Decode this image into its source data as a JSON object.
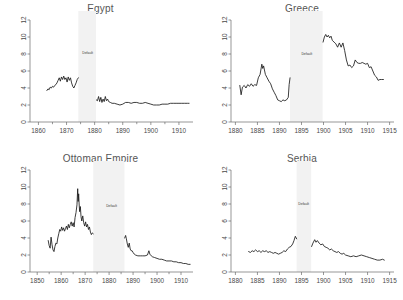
{
  "figure": {
    "panel_order": [
      "egypt",
      "greece",
      "ottoman",
      "serbia"
    ],
    "annotation_label": "Default",
    "series_color": "#1a1a1a",
    "band_color": "#f2f2f2",
    "axis_color": "#6b6b6b",
    "title_color": "#555555"
  },
  "chart_data": [
    {
      "type": "line",
      "title": "Egypt",
      "xlabel": "",
      "ylabel": "",
      "xlim": [
        1857,
        1915
      ],
      "ylim": [
        0,
        12
      ],
      "yticks": [
        0,
        2,
        4,
        6,
        8,
        10,
        12
      ],
      "xticks": [
        1860,
        1870,
        1880,
        1890,
        1900,
        1910
      ],
      "xminor": [
        1865,
        1875,
        1885,
        1895,
        1905
      ],
      "grid": false,
      "legend": "none",
      "annotations": [
        {
          "text": "Default",
          "x": 1877.5,
          "y": 8.0
        }
      ],
      "default_band": [
        1874.2,
        1880.5
      ],
      "series": [
        {
          "name": "pre-default",
          "x": [
            1863.0,
            1863.4,
            1863.8,
            1864.2,
            1864.6,
            1865.0,
            1865.4,
            1865.8,
            1866.2,
            1866.6,
            1867.0,
            1867.4,
            1867.8,
            1868.2,
            1868.6,
            1869.0,
            1869.4,
            1869.8,
            1870.2,
            1870.6,
            1871.0,
            1871.4,
            1871.8,
            1872.2,
            1872.6,
            1873.0,
            1873.4,
            1873.8,
            1874.2
          ],
          "values": [
            3.7,
            3.9,
            3.8,
            4.1,
            4.0,
            4.2,
            4.1,
            4.3,
            4.4,
            4.6,
            4.9,
            5.2,
            4.8,
            5.3,
            5.0,
            5.4,
            5.0,
            5.2,
            4.7,
            5.3,
            4.9,
            5.2,
            4.6,
            4.2,
            4.0,
            4.3,
            4.6,
            5.0,
            5.2
          ]
        },
        {
          "name": "post-default",
          "x": [
            1880.6,
            1881.0,
            1881.4,
            1881.8,
            1882.2,
            1882.6,
            1883.0,
            1883.4,
            1883.8,
            1884.2,
            1884.6,
            1885.0,
            1885.6,
            1886.2,
            1887.0,
            1888.0,
            1889.0,
            1890.0,
            1891.0,
            1892.0,
            1893.0,
            1894.0,
            1895.0,
            1896.0,
            1897.0,
            1898.0,
            1899.0,
            1900.0,
            1901.0,
            1902.0,
            1903.0,
            1904.0,
            1905.0,
            1906.0,
            1907.0,
            1908.0,
            1909.0,
            1910.0,
            1911.0,
            1912.0,
            1913.0,
            1913.6
          ],
          "values": [
            2.6,
            2.5,
            3.0,
            2.4,
            2.9,
            2.3,
            2.7,
            2.4,
            3.0,
            2.5,
            2.7,
            2.4,
            2.3,
            2.2,
            2.2,
            2.1,
            2.0,
            2.1,
            2.3,
            2.3,
            2.2,
            2.3,
            2.3,
            2.2,
            2.2,
            2.3,
            2.2,
            2.1,
            2.0,
            2.0,
            2.0,
            2.1,
            2.1,
            2.1,
            2.2,
            2.2,
            2.2,
            2.2,
            2.2,
            2.2,
            2.2,
            2.2
          ]
        }
      ]
    },
    {
      "type": "line",
      "title": "Greece",
      "xlabel": "",
      "ylabel": "",
      "xlim": [
        1879,
        1916
      ],
      "ylim": [
        0,
        12
      ],
      "yticks": [
        0,
        2,
        4,
        6,
        8,
        10,
        12
      ],
      "xticks": [
        1880,
        1885,
        1890,
        1895,
        1900,
        1905,
        1910,
        1915
      ],
      "xminor": [],
      "grid": false,
      "legend": "none",
      "annotations": [
        {
          "text": "Default",
          "x": 1896.2,
          "y": 7.9
        }
      ],
      "default_band": [
        1892.4,
        1899.8
      ],
      "series": [
        {
          "name": "pre-default",
          "x": [
            1881.0,
            1881.3,
            1881.6,
            1882.0,
            1882.4,
            1882.8,
            1883.2,
            1883.6,
            1884.0,
            1884.4,
            1884.8,
            1885.2,
            1885.6,
            1886.0,
            1886.2,
            1886.4,
            1886.8,
            1887.2,
            1887.6,
            1888.0,
            1888.4,
            1888.8,
            1889.2,
            1889.6,
            1890.0,
            1890.4,
            1890.8,
            1891.2,
            1891.6,
            1892.0,
            1892.2,
            1892.4
          ],
          "values": [
            4.3,
            3.2,
            4.1,
            4.3,
            4.0,
            4.4,
            4.2,
            4.5,
            4.2,
            4.4,
            4.3,
            5.2,
            5.6,
            6.8,
            6.3,
            6.6,
            5.6,
            5.2,
            4.8,
            4.5,
            3.9,
            3.5,
            3.1,
            2.6,
            2.5,
            2.4,
            2.6,
            2.5,
            2.6,
            2.9,
            4.4,
            5.2
          ]
        },
        {
          "name": "post-default",
          "x": [
            1899.9,
            1900.2,
            1900.5,
            1900.8,
            1901.1,
            1901.4,
            1901.7,
            1902.0,
            1902.4,
            1902.8,
            1903.2,
            1903.6,
            1904.0,
            1904.4,
            1904.8,
            1905.2,
            1905.6,
            1906.0,
            1906.4,
            1906.8,
            1907.2,
            1907.6,
            1908.0,
            1908.4,
            1908.8,
            1909.2,
            1909.6,
            1910.0,
            1910.4,
            1910.8,
            1911.2,
            1911.6,
            1912.0,
            1912.4,
            1912.8,
            1913.2,
            1913.6
          ],
          "values": [
            9.4,
            10.0,
            10.3,
            10.0,
            10.2,
            9.9,
            10.1,
            9.6,
            9.4,
            9.2,
            8.8,
            9.3,
            8.8,
            9.3,
            8.4,
            7.3,
            6.6,
            6.7,
            6.4,
            6.6,
            7.3,
            7.0,
            6.9,
            6.9,
            7.0,
            6.9,
            6.8,
            6.9,
            6.4,
            6.5,
            6.0,
            5.5,
            5.3,
            4.9,
            5.0,
            5.0,
            5.0
          ]
        }
      ]
    },
    {
      "type": "line",
      "title": "Ottoman Empire",
      "xlabel": "",
      "ylabel": "",
      "xlim": [
        1847,
        1915
      ],
      "ylim": [
        0,
        12
      ],
      "yticks": [
        0,
        2,
        4,
        6,
        8,
        10,
        12
      ],
      "xticks": [
        1850,
        1860,
        1870,
        1880,
        1890,
        1900,
        1910
      ],
      "xminor": [
        1855,
        1865,
        1875,
        1885,
        1895,
        1905
      ],
      "grid": false,
      "legend": "none",
      "annotations": [
        {
          "text": "Default",
          "x": 1881.0,
          "y": 7.7
        }
      ],
      "default_band": [
        1873.4,
        1886.4
      ],
      "series": [
        {
          "name": "pre-default",
          "x": [
            1854.6,
            1855.0,
            1855.4,
            1855.8,
            1856.2,
            1856.6,
            1857.0,
            1857.4,
            1857.8,
            1858.2,
            1858.6,
            1859.0,
            1859.4,
            1859.8,
            1860.2,
            1860.6,
            1861.0,
            1861.4,
            1861.8,
            1862.2,
            1862.6,
            1863.0,
            1863.4,
            1863.8,
            1864.2,
            1864.6,
            1865.0,
            1865.4,
            1865.8,
            1866.2,
            1866.6,
            1866.9,
            1867.1,
            1867.3,
            1867.5,
            1867.7,
            1868.0,
            1868.3,
            1868.6,
            1869.0,
            1869.4,
            1869.8,
            1870.2,
            1870.6,
            1871.0,
            1871.4,
            1871.8,
            1872.2,
            1872.6,
            1873.0,
            1873.4
          ],
          "values": [
            3.7,
            3.1,
            2.8,
            4.1,
            3.2,
            2.6,
            2.4,
            3.0,
            3.4,
            3.3,
            4.0,
            4.5,
            5.0,
            4.8,
            5.3,
            4.9,
            5.2,
            4.8,
            5.1,
            5.4,
            5.0,
            5.6,
            5.2,
            5.6,
            5.9,
            5.4,
            5.8,
            5.3,
            6.4,
            7.0,
            7.9,
            9.8,
            8.3,
            9.2,
            8.0,
            7.1,
            7.7,
            6.5,
            6.0,
            6.6,
            5.8,
            5.4,
            5.9,
            5.3,
            5.6,
            5.0,
            5.3,
            4.7,
            4.4,
            4.6,
            4.5
          ]
        },
        {
          "name": "post-default",
          "x": [
            1886.5,
            1886.9,
            1887.2,
            1887.6,
            1888.0,
            1888.4,
            1888.8,
            1889.2,
            1889.6,
            1890.0,
            1890.5,
            1891.0,
            1892.0,
            1893.0,
            1894.0,
            1895.0,
            1896.0,
            1896.6,
            1897.0,
            1897.6,
            1898.0,
            1899.0,
            1900.0,
            1901.0,
            1902.0,
            1903.0,
            1904.0,
            1905.0,
            1906.0,
            1907.0,
            1908.0,
            1909.0,
            1910.0,
            1911.0,
            1912.0,
            1913.0,
            1913.8
          ],
          "values": [
            4.0,
            4.3,
            3.9,
            3.3,
            2.9,
            3.4,
            2.7,
            2.5,
            2.5,
            2.3,
            2.1,
            2.0,
            1.9,
            1.9,
            1.9,
            1.9,
            2.0,
            2.5,
            2.1,
            1.9,
            1.8,
            1.7,
            1.6,
            1.5,
            1.5,
            1.4,
            1.3,
            1.3,
            1.3,
            1.2,
            1.2,
            1.1,
            1.1,
            1.0,
            1.0,
            0.9,
            0.9
          ]
        }
      ]
    },
    {
      "type": "line",
      "title": "Serbia",
      "xlabel": "",
      "ylabel": "",
      "xlim": [
        1879,
        1916
      ],
      "ylim": [
        0,
        12
      ],
      "yticks": [
        0,
        2,
        4,
        6,
        8,
        10,
        12
      ],
      "xticks": [
        1880,
        1885,
        1890,
        1895,
        1900,
        1905,
        1910,
        1915
      ],
      "xminor": [],
      "grid": false,
      "legend": "none",
      "annotations": [
        {
          "text": "Default",
          "x": 1895.5,
          "y": 7.9
        }
      ],
      "default_band": [
        1893.9,
        1897.2
      ],
      "series": [
        {
          "name": "pre-default",
          "x": [
            1883.0,
            1883.4,
            1883.8,
            1884.2,
            1884.6,
            1885.0,
            1885.4,
            1885.8,
            1886.2,
            1886.6,
            1887.0,
            1887.4,
            1887.8,
            1888.2,
            1888.6,
            1889.0,
            1889.4,
            1889.8,
            1890.2,
            1890.6,
            1891.0,
            1891.4,
            1891.8,
            1892.2,
            1892.6,
            1893.0,
            1893.3,
            1893.6,
            1893.9
          ],
          "values": [
            2.4,
            2.3,
            2.5,
            2.4,
            2.6,
            2.4,
            2.5,
            2.3,
            2.5,
            2.4,
            2.5,
            2.3,
            2.4,
            2.3,
            2.2,
            2.3,
            2.2,
            2.1,
            2.2,
            2.3,
            2.5,
            2.4,
            2.7,
            2.9,
            3.0,
            3.3,
            3.7,
            4.2,
            3.9
          ]
        },
        {
          "name": "post-default",
          "x": [
            1897.3,
            1897.6,
            1898.0,
            1898.3,
            1898.6,
            1899.0,
            1899.4,
            1899.8,
            1900.2,
            1900.6,
            1901.0,
            1901.4,
            1901.8,
            1902.2,
            1902.6,
            1903.0,
            1903.4,
            1903.8,
            1904.2,
            1904.6,
            1905.0,
            1905.6,
            1906.2,
            1906.8,
            1907.4,
            1908.0,
            1908.6,
            1909.2,
            1909.8,
            1910.4,
            1911.0,
            1911.6,
            1912.2,
            1912.8,
            1913.4,
            1913.8
          ],
          "values": [
            3.0,
            3.4,
            3.8,
            3.5,
            3.7,
            3.4,
            3.2,
            3.3,
            3.0,
            2.9,
            2.8,
            2.6,
            2.7,
            2.5,
            2.4,
            2.3,
            2.4,
            2.2,
            2.1,
            2.2,
            2.0,
            1.9,
            1.8,
            1.9,
            1.8,
            1.9,
            2.0,
            1.9,
            1.8,
            1.7,
            1.6,
            1.5,
            1.4,
            1.4,
            1.5,
            1.4
          ]
        }
      ]
    }
  ]
}
